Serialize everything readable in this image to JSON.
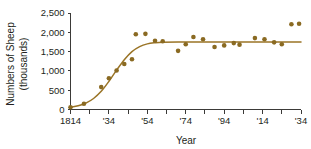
{
  "chart_data": {
    "type": "scatter",
    "title": "",
    "xlabel": "Year",
    "ylabel": "Numbers of Sheep (thousands)",
    "ylabel_line1": "Numbers of Sheep",
    "ylabel_line2": "(thousands)",
    "xlim": [
      1814,
      1934
    ],
    "ylim": [
      0,
      2500
    ],
    "grid": false,
    "legend": false,
    "y_ticks": [
      0,
      500,
      1000,
      1500,
      2000,
      2500
    ],
    "y_tick_labels": [
      "0",
      "500",
      "1,000",
      "1,500",
      "2,000",
      "2,500"
    ],
    "x_ticks": [
      1814,
      1824,
      1834,
      1844,
      1854,
      1864,
      1874,
      1884,
      1894,
      1904,
      1914,
      1924,
      1934
    ],
    "x_tick_labels": [
      "1814",
      "",
      "'34",
      "",
      "'54",
      "",
      "'74",
      "",
      "'94",
      "",
      "'14",
      "",
      "'34"
    ],
    "series": [
      {
        "name": "Sheep population",
        "marker": "circle",
        "color": "#8a6a22",
        "points": [
          {
            "x": 1814,
            "y": 60
          },
          {
            "x": 1821,
            "y": 150
          },
          {
            "x": 1830,
            "y": 580
          },
          {
            "x": 1834,
            "y": 810
          },
          {
            "x": 1838,
            "y": 1010
          },
          {
            "x": 1842,
            "y": 1180
          },
          {
            "x": 1846,
            "y": 1300
          },
          {
            "x": 1848,
            "y": 1950
          },
          {
            "x": 1853,
            "y": 1960
          },
          {
            "x": 1858,
            "y": 1780
          },
          {
            "x": 1862,
            "y": 1770
          },
          {
            "x": 1870,
            "y": 1520
          },
          {
            "x": 1874,
            "y": 1690
          },
          {
            "x": 1878,
            "y": 1880
          },
          {
            "x": 1883,
            "y": 1820
          },
          {
            "x": 1889,
            "y": 1620
          },
          {
            "x": 1894,
            "y": 1660
          },
          {
            "x": 1899,
            "y": 1720
          },
          {
            "x": 1902,
            "y": 1680
          },
          {
            "x": 1910,
            "y": 1850
          },
          {
            "x": 1915,
            "y": 1820
          },
          {
            "x": 1920,
            "y": 1740
          },
          {
            "x": 1924,
            "y": 1690
          },
          {
            "x": 1929,
            "y": 2210
          },
          {
            "x": 1933,
            "y": 2220
          }
        ]
      }
    ],
    "fit_curve": {
      "name": "Logistic growth curve",
      "color": "#9a7426",
      "model": "logistic",
      "carrying_capacity": 1750,
      "midpoint_year": 1837,
      "points": [
        {
          "x": 1814,
          "y": 55
        },
        {
          "x": 1818,
          "y": 95
        },
        {
          "x": 1822,
          "y": 165
        },
        {
          "x": 1826,
          "y": 285
        },
        {
          "x": 1830,
          "y": 470
        },
        {
          "x": 1834,
          "y": 730
        },
        {
          "x": 1838,
          "y": 1020
        },
        {
          "x": 1842,
          "y": 1290
        },
        {
          "x": 1846,
          "y": 1500
        },
        {
          "x": 1850,
          "y": 1630
        },
        {
          "x": 1854,
          "y": 1700
        },
        {
          "x": 1858,
          "y": 1730
        },
        {
          "x": 1862,
          "y": 1745
        },
        {
          "x": 1870,
          "y": 1750
        },
        {
          "x": 1890,
          "y": 1750
        },
        {
          "x": 1910,
          "y": 1750
        },
        {
          "x": 1934,
          "y": 1750
        }
      ]
    }
  }
}
